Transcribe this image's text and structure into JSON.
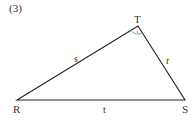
{
  "problem_number": "(3)",
  "vertices": {
    "R": {
      "label": "R",
      "x": 17,
      "y": 100
    },
    "T": {
      "label": "T",
      "x": 138,
      "y": 26
    },
    "S": {
      "label": "S",
      "x": 185,
      "y": 100
    }
  },
  "sides": {
    "s": {
      "label": "s",
      "between": [
        "R",
        "T"
      ]
    },
    "r": {
      "label": "r",
      "between": [
        "T",
        "S"
      ]
    },
    "t": {
      "label": "t",
      "between": [
        "R",
        "S"
      ]
    }
  },
  "angle_mark": {
    "vertex": "T",
    "color": "#5fb3c8"
  },
  "colors": {
    "line": "#222222",
    "text": "#333333",
    "accent": "#5fb3c8"
  }
}
